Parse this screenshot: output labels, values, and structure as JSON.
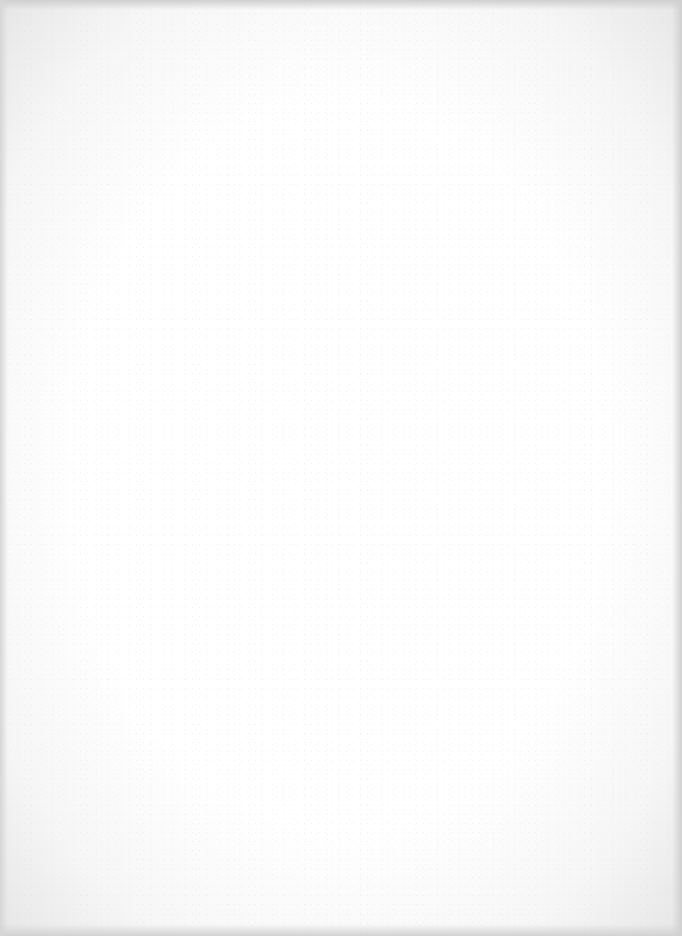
{
  "document": {
    "type": "scanned-page",
    "content_text": "",
    "background_color": "#ffffff",
    "edge_shade_color": "#d0d0d0"
  }
}
